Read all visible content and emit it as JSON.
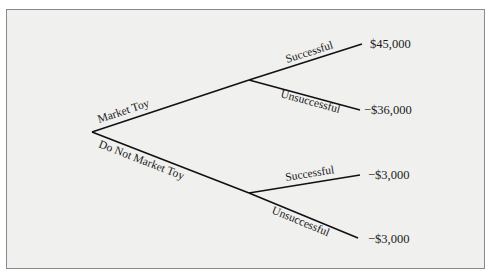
{
  "diagram": {
    "type": "decision-tree",
    "root": {
      "branches": [
        {
          "label": "Market Toy",
          "children": [
            {
              "label": "Successful",
              "payoff": "$45,000"
            },
            {
              "label": "Unsuccessful",
              "payoff": "−$36,000"
            }
          ]
        },
        {
          "label": "Do Not Market Toy",
          "children": [
            {
              "label": "Successful",
              "payoff": "−$3,000"
            },
            {
              "label": "Unsuccessful",
              "payoff": "−$3,000"
            }
          ]
        }
      ]
    }
  }
}
